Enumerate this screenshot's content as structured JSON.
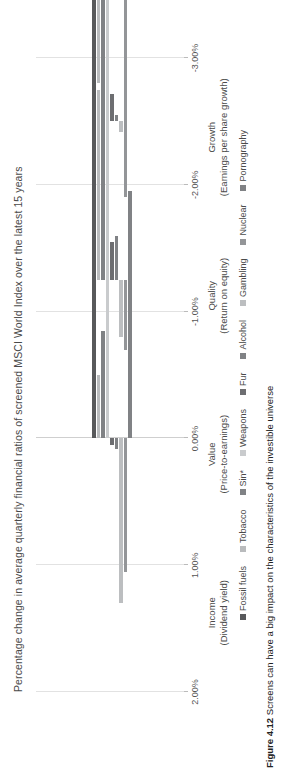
{
  "chart_data": {
    "type": "bar",
    "orientation": "horizontal-grouped",
    "title": "Percentage change in average quarterly financial ratios of screened MSCI World Index over the latest 15 years",
    "xlabel": "",
    "ylabel": "",
    "xlim": [
      2.0,
      -3.0
    ],
    "xticks": [
      "2.00%",
      "1.00%",
      "0.00%",
      "-1.00%",
      "-2.00%",
      "-3.00%"
    ],
    "xtick_values": [
      2.0,
      1.0,
      0.0,
      -1.0,
      -2.0,
      -3.0
    ],
    "grid": true,
    "legend_position": "bottom",
    "categories": [
      "Income",
      "Value",
      "Quality",
      "Growth"
    ],
    "category_sublabels": [
      "(Dividend yield)",
      "(Price-to-earnings)",
      "(Return on equity)",
      "(Earnings per share growth)"
    ],
    "series": [
      {
        "name": "Fossil fuels",
        "color": "#58595b",
        "values": [
          -2.95,
          -2.45,
          -1.3,
          -0.2
        ]
      },
      {
        "name": "Tobacco",
        "color": "#b9bbbd",
        "values": [
          -0.5,
          -1.5,
          1.05,
          0.95
        ]
      },
      {
        "name": "Sin*",
        "color": "#808285",
        "values": [
          -0.85,
          -1.55,
          0.9,
          1.25
        ]
      },
      {
        "name": "Weapons",
        "color": "#c9cbcd",
        "values": [
          -1.95,
          -1.05,
          1.2,
          1.45
        ]
      },
      {
        "name": "Fur",
        "color": "#6d6e71",
        "values": [
          0.05,
          -0.3,
          -0.22,
          -0.25
        ]
      },
      {
        "name": "Alcohol",
        "color": "#808285",
        "values": [
          0.08,
          -0.35,
          -0.05,
          -0.35
        ]
      },
      {
        "name": "Gambling",
        "color": "#bcbec0",
        "values": [
          1.3,
          0.45,
          0.08,
          0.05
        ]
      },
      {
        "name": "Nuclear",
        "color": "#939598",
        "values": [
          1.05,
          0.55,
          0.6,
          1.75
        ]
      },
      {
        "name": "Pornography",
        "color": "#808285",
        "values": [
          -1.95,
          0.0,
          0.0,
          0.0
        ]
      }
    ]
  },
  "caption": {
    "figure_number": "Figure 4.12",
    "text": "Screens can have a big impact on the characteristics of the investible universe"
  }
}
